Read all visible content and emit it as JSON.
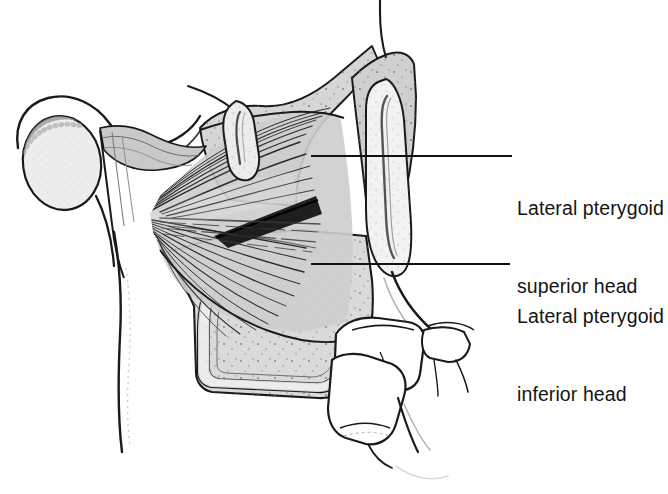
{
  "figure": {
    "width": 668,
    "height": 494,
    "background_color": "#ffffff"
  },
  "labels": [
    {
      "id": "superior",
      "line1": "Lateral pterygoid",
      "line2": "superior head",
      "text_x": 517,
      "text_y": 143,
      "leader": {
        "x1": 311,
        "y1": 156,
        "x2": 512,
        "y2": 156
      }
    },
    {
      "id": "inferior",
      "line1": "Lateral pterygoid",
      "line2": "inferior head",
      "text_x": 517,
      "text_y": 251,
      "leader": {
        "x1": 311,
        "y1": 264,
        "x2": 510,
        "y2": 264
      }
    }
  ],
  "structures": [
    {
      "name": "mandibular-condyle",
      "description": "Oval condylar head, upper left"
    },
    {
      "name": "articular-disc",
      "description": "Biconcave disc capping the condyle"
    },
    {
      "name": "articular-eminence",
      "description": "Temporal bone eminence above the disc"
    },
    {
      "name": "lateral-pterygoid-superior-head",
      "description": "Upper fan of muscle fibers inserting on the disc and condylar neck"
    },
    {
      "name": "lateral-pterygoid-inferior-head",
      "description": "Lower larger fan of muscle fibers to the pterygoid plate"
    },
    {
      "name": "coronoid-process",
      "description": "Vertical bony process at right with temporalis tendon"
    },
    {
      "name": "lateral-pterygoid-plate",
      "description": "Hook-shaped plate at lower left of the muscle mass"
    },
    {
      "name": "maxillary-molars",
      "description": "Two molar tooth crowns with roots, lower right"
    },
    {
      "name": "cut-vessel",
      "description": "Transected vessel stump at upper left of the fossa"
    }
  ],
  "colors": {
    "outline": "#1a1a1a",
    "bone_fill": "#d9d9d9",
    "muscle_fill": "#cccccc",
    "disc_fill": "#f0f0f0",
    "condyle_fill": "#ededed",
    "tooth_fill": "#ffffff",
    "stipple": "#8a8a8a",
    "leader_line": "#111111",
    "text": "#141414"
  }
}
